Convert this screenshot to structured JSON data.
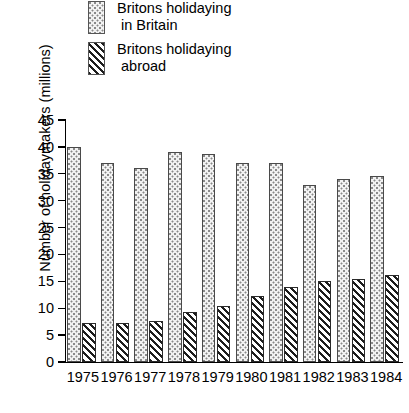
{
  "chart_data": {
    "type": "bar",
    "title": "",
    "xlabel": "",
    "ylabel": "Number of holidaymakers (millions)",
    "categories": [
      "1975",
      "1976",
      "1977",
      "1978",
      "1979",
      "1980",
      "1981",
      "1982",
      "1983",
      "1984"
    ],
    "series": [
      {
        "name": "Britons holidaying in Britain",
        "pattern": "dotted",
        "values": [
          40.0,
          37.0,
          36.0,
          39.0,
          38.7,
          37.0,
          37.0,
          33.0,
          34.0,
          34.5
        ]
      },
      {
        "name": "Britons holidaying abroad",
        "pattern": "hatched",
        "values": [
          7.2,
          7.2,
          7.6,
          9.3,
          10.5,
          12.2,
          14.0,
          15.0,
          15.5,
          16.2
        ]
      }
    ],
    "ylim": [
      0,
      45
    ],
    "ytick_step": 5,
    "yticks": [
      0,
      5,
      10,
      15,
      20,
      25,
      30,
      35,
      40,
      45
    ],
    "ytick_labels": [
      "0",
      "5",
      "10",
      "15",
      "20",
      "25",
      "30",
      "35",
      "40",
      "45"
    ],
    "grid": false,
    "legend_position": "top-left"
  },
  "legend": {
    "items": [
      {
        "label_line1": "Britons holidaying",
        "label_line2": " in Britain",
        "swatch": "dotted-swatch"
      },
      {
        "label_line1": "Britons holidaying",
        "label_line2": " abroad",
        "swatch": "hatched-swatch"
      }
    ]
  }
}
